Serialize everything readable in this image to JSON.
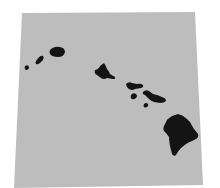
{
  "map": {
    "subject": "Hawaiian Islands",
    "colors": {
      "page_bg": "#ffffff",
      "ocean": "#bdbdbd",
      "land": "#141414"
    },
    "ocean_polygon": "22,13 195,12 203,185 14,188",
    "islands": [
      {
        "name": "niihau",
        "path": "M25,66 q3,-2 4,1 q0,3 -3,3 q-2,-1 -1,-4z"
      },
      {
        "name": "kauai-west",
        "path": "M36,61 q4,-6 7,-5 q2,2 -2,6 q-3,3 -5,2 q-1,-1 0,-3z"
      },
      {
        "name": "kauai",
        "path": "M50,50 q4,-4 10,-3 q5,1 5,5 q-1,5 -7,5 q-6,0 -8,-3 q-1,-2 0,-4z"
      },
      {
        "name": "oahu",
        "path": "M95,70 q4,-1 5,-4 l4,-3 q2,3 3,6 q2,2 3,5 l5,3 q1,2 -2,2 l-6,-1 q-3,2 -6,0 l-4,-3 q-3,-1 -2,-5z"
      },
      {
        "name": "molokai",
        "path": "M126,84 q3,-3 6,-1 l5,1 q4,-1 6,1 q1,2 -2,3 l-6,1 q-3,2 -6,0 q-3,-2 -3,-5z"
      },
      {
        "name": "lanai",
        "path": "M131,95 q2,-3 5,-1 q2,2 0,4 q-2,2 -4,1 q-2,-1 -1,-4z"
      },
      {
        "name": "maui",
        "path": "M143,92 q3,-3 6,-1 l4,3 q5,1 9,3 q4,1 4,4 q-2,2 -6,2 l-6,-1 q-3,-1 -5,-3 l-4,-4 q-3,-1 -2,-3z"
      },
      {
        "name": "kahoolawe",
        "path": "M144,104 q2,-2 4,0 q1,2 -1,3 q-2,1 -3,0 q-1,-1 0,-3z"
      },
      {
        "name": "hawaii-big-island",
        "path": "M172,116 l6,-2 q5,1 9,5 l3,3 q2,4 4,7 l4,5 q1,3 -2,5 l-4,2 q-3,1 -6,3 l-5,4 q-3,3 -5,7 q-2,2 -4,-1 l-2,-8 q-1,-5 -1,-9 l-3,-4 q-4,-3 -2,-7 l2,-4 q1,-3 2,-3z"
      }
    ]
  }
}
